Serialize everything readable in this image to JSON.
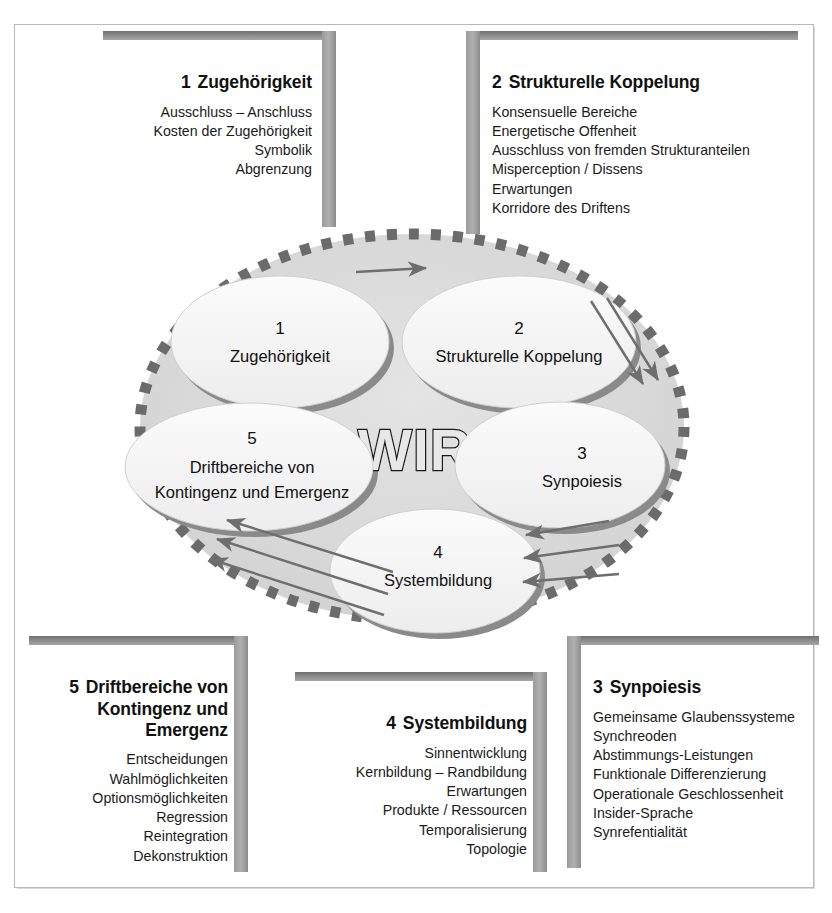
{
  "figure": {
    "center_label": "WIR",
    "core_ellipses": [
      {
        "num": "1",
        "lines": [
          "Zugehörigkeit"
        ]
      },
      {
        "num": "2",
        "lines": [
          "Strukturelle Koppelung"
        ]
      },
      {
        "num": "3",
        "lines": [
          "Synpoiesis"
        ]
      },
      {
        "num": "4",
        "lines": [
          "Systembildung"
        ]
      },
      {
        "num": "5",
        "lines": [
          "Driftbereiche von",
          "Kontingenz und Emergenz"
        ]
      }
    ],
    "arrows": [
      {
        "name": "arrow-top-right",
        "count": 1,
        "direction": "right"
      },
      {
        "name": "arrows-coupling-to-synpoiesis",
        "count": 2,
        "direction": "down-right"
      },
      {
        "name": "arrows-synpoiesis-to-systembildung",
        "count": 3,
        "direction": "left"
      },
      {
        "name": "arrows-systembildung-to-driftbereiche",
        "count": 3,
        "direction": "up-left"
      }
    ],
    "colors": {
      "outer_ring_dash": "#6b6b6b",
      "outer_fill": "#d9d9d9",
      "ellipse_fill": "#f2f2f2",
      "ellipse_shadow": "#8a8a8a",
      "ellipse_stroke": "#c9c9c9",
      "arrow": "#6e6e6e",
      "wir_outline": "#1a1a1a",
      "wir_fill": "#e8e8e8"
    }
  },
  "boxes": {
    "box1": {
      "number": "1",
      "title": "Zugehörigkeit",
      "align": "right",
      "items": [
        "Ausschluss – Anschluss",
        "Kosten der Zugehörigkeit",
        "Symbolik",
        "Abgrenzung"
      ]
    },
    "box2": {
      "number": "2",
      "title": "Strukturelle Koppelung",
      "align": "left",
      "items": [
        "Konsensuelle Bereiche",
        "Energetische Offenheit",
        "Ausschluss von fremden Strukturanteilen",
        "Misperception / Dissens",
        "Erwartungen",
        "Korridore des Driftens"
      ]
    },
    "box3": {
      "number": "3",
      "title": "Synpoiesis",
      "align": "left",
      "items": [
        "Gemeinsame Glaubenssysteme",
        "Synchreoden",
        "Abstimmungs-Leistungen",
        "Funktionale Differenzierung",
        "Operationale Geschlossenheit",
        "Insider-Sprache",
        "Synrefentialität"
      ]
    },
    "box4": {
      "number": "4",
      "title": "Systembildung",
      "align": "right",
      "items": [
        "Sinnentwicklung",
        "Kernbildung – Randbildung",
        "Erwartungen",
        "Produkte / Ressourcen",
        "Temporalisierung",
        "Topologie"
      ]
    },
    "box5": {
      "number": "5",
      "title": "Driftbereiche von\nKontingenz und\nEmergenz",
      "align": "right",
      "items": [
        "Entscheidungen",
        "Wahlmöglichkeiten",
        "Optionsmöglichkeiten",
        "Regression",
        "Reintegration",
        "Dekonstruktion"
      ]
    }
  }
}
